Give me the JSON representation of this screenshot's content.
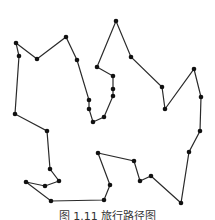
{
  "figure": {
    "caption": "图 1.11  旅行路径图",
    "line_color": "#2a2a2a",
    "point_color": "#111111",
    "tour": [
      [
        16,
        43
      ],
      [
        37,
        59
      ],
      [
        66,
        37
      ],
      [
        77,
        60
      ],
      [
        89,
        100
      ],
      [
        89,
        109
      ],
      [
        93,
        122
      ],
      [
        104,
        117
      ],
      [
        113,
        96
      ],
      [
        113,
        89
      ],
      [
        113,
        76
      ],
      [
        97,
        67
      ],
      [
        116,
        21
      ],
      [
        131,
        57
      ],
      [
        162,
        87
      ],
      [
        165,
        109
      ],
      [
        194,
        69
      ],
      [
        201,
        97
      ],
      [
        200,
        131
      ],
      [
        189,
        152
      ],
      [
        181,
        203
      ],
      [
        151,
        176
      ],
      [
        140,
        181
      ],
      [
        134,
        161
      ],
      [
        98,
        153
      ],
      [
        110,
        185
      ],
      [
        104,
        200
      ],
      [
        51,
        201
      ],
      [
        26,
        182
      ],
      [
        45,
        186
      ],
      [
        59,
        181
      ],
      [
        50,
        169
      ],
      [
        47,
        131
      ],
      [
        15,
        114
      ],
      [
        19,
        56
      ]
    ],
    "closed": true
  }
}
